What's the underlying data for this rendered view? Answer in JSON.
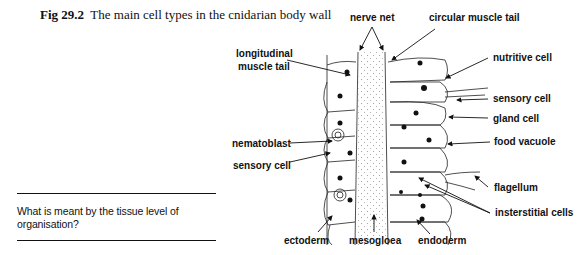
{
  "caption": {
    "figure_number": "Fig 29.2",
    "title": "The main cell types in the cnidarian body wall"
  },
  "question": {
    "text": "What is meant by the tissue level of organisation?"
  },
  "diagram": {
    "labels": {
      "nerve_net": "nerve net",
      "circular_muscle_tail": "circular muscle tail",
      "longitudinal_muscle_tail_line1": "longitudinal",
      "longitudinal_muscle_tail_line2": "muscle tail",
      "nutritive_cell": "nutritive cell",
      "sensory_cell_right": "sensory cell",
      "gland_cell": "gland cell",
      "food_vacuole": "food vacuole",
      "nematoblast": "nematoblast",
      "sensory_cell_left": "sensory cell",
      "flagellum": "flagellum",
      "interstitial_cells": "insterstitial cells",
      "ectoderm": "ectoderm",
      "mesogloea": "mesogloea",
      "endoderm": "endoderm"
    }
  }
}
